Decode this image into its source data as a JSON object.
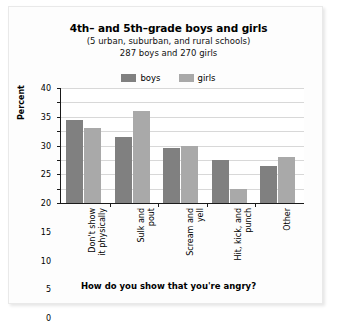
{
  "colors": {
    "boys": "#808080",
    "girls": "#a9a9a9",
    "axis": "#1a1a1a",
    "grid": "#d8d8d8",
    "background": "#ffffff",
    "card_border": "#e9e9e9"
  },
  "header": {
    "title": "4th– and 5th–grade boys and girls",
    "subtitle_line1": "(5 urban, suburban, and rural schools)",
    "subtitle_line2": "287 boys and 270 girls"
  },
  "legend": {
    "position": "top-center",
    "items": [
      {
        "label": "boys",
        "color": "#808080",
        "swatch_name": "legend-swatch-boys"
      },
      {
        "label": "girls",
        "color": "#a9a9a9",
        "swatch_name": "legend-swatch-girls"
      }
    ]
  },
  "axes": {
    "y_title": "Percent",
    "y_ticks": [
      "0",
      "5",
      "10",
      "15",
      "20",
      "25",
      "30",
      "35",
      "40"
    ],
    "x_caption": "How do you show that you're angry?"
  },
  "chart_data": {
    "type": "bar",
    "title": "4th– and 5th–grade boys and girls",
    "subtitle": "(5 urban, suburban, and rural schools) 287 boys and 270 girls",
    "xlabel": "How do you show that you're angry?",
    "ylabel": "Percent",
    "ylim": [
      0,
      40
    ],
    "ytick_step": 5,
    "grid": true,
    "legend_position": "top-center",
    "categories": [
      "Don't show\nit physically",
      "Sulk and\npout",
      "Scream and\nyell",
      "Hit, kick, and\npunch",
      "Other"
    ],
    "category_lines": [
      [
        "Don't show",
        "it physically"
      ],
      [
        "Sulk and",
        "pout"
      ],
      [
        "Scream and",
        "yell"
      ],
      [
        "Hit, kick, and",
        "punch"
      ],
      [
        "Other"
      ]
    ],
    "series": [
      {
        "name": "boys",
        "color": "#808080",
        "values": [
          29,
          23,
          19,
          15,
          13
        ]
      },
      {
        "name": "girls",
        "color": "#a9a9a9",
        "values": [
          26,
          32,
          20,
          5,
          16
        ]
      }
    ]
  }
}
